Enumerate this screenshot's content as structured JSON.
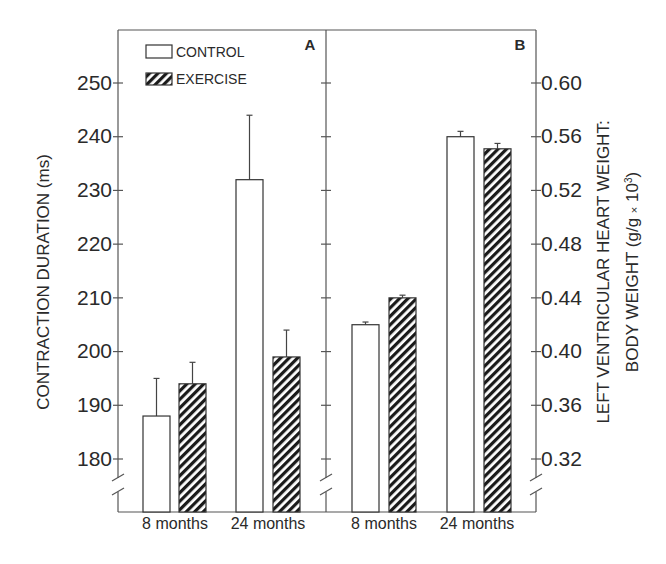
{
  "chart_data": [
    {
      "panel": "A",
      "type": "bar",
      "title": "A",
      "categories": [
        "8 months",
        "24 months"
      ],
      "series": [
        {
          "name": "CONTROL",
          "values": [
            188,
            232
          ],
          "error_upper": [
            195,
            244
          ],
          "pattern": "open"
        },
        {
          "name": "EXERCISE",
          "values": [
            194,
            199
          ],
          "error_upper": [
            198,
            204
          ],
          "pattern": "hatched"
        }
      ],
      "ylabel": "CONTRACTION DURATION (ms)",
      "yticks": [
        180,
        190,
        200,
        210,
        220,
        230,
        240,
        250
      ],
      "ylim": [
        180,
        250
      ],
      "axis_break": true,
      "grid": false,
      "legend_position": "upper left"
    },
    {
      "panel": "B",
      "type": "bar",
      "title": "B",
      "categories": [
        "8 months",
        "24 months"
      ],
      "series": [
        {
          "name": "CONTROL",
          "values": [
            0.42,
            0.56
          ],
          "error_upper": [
            0.422,
            0.564
          ],
          "pattern": "open"
        },
        {
          "name": "EXERCISE",
          "values": [
            0.44,
            0.551
          ],
          "error_upper": [
            0.442,
            0.555
          ],
          "pattern": "hatched"
        }
      ],
      "ylabel": "LEFT VENTRICULAR HEART WEIGHT: BODY WEIGHT (g/g × 10³)",
      "yticks": [
        0.32,
        0.36,
        0.4,
        0.44,
        0.48,
        0.52,
        0.56,
        0.6
      ],
      "ylim": [
        0.32,
        0.6
      ],
      "axis_break": true,
      "grid": false
    }
  ],
  "legend": {
    "control_label": "CONTROL",
    "exercise_label": "EXERCISE"
  },
  "panels": {
    "a_label": "A",
    "b_label": "B"
  },
  "axes": {
    "left_label": "CONTRACTION DURATION (ms)",
    "right_label_line1": "LEFT VENTRICULAR HEART WEIGHT:",
    "right_label_line2_main": "BODY WEIGHT (g/g ",
    "right_label_line2_times": "×",
    "right_label_line2_end": " 10",
    "right_label_line2_sup": "3",
    "right_label_line2_close": ")",
    "left_ticks": [
      "180",
      "190",
      "200",
      "210",
      "220",
      "230",
      "240",
      "250"
    ],
    "right_ticks": [
      "0.32",
      "0.36",
      "0.40",
      "0.44",
      "0.48",
      "0.52",
      "0.56",
      "0.60"
    ],
    "x_categories_a": [
      "8 months",
      "24 months"
    ],
    "x_categories_b": [
      "8 months",
      "24 months"
    ]
  },
  "colors": {
    "ink": "#2a2a2a",
    "background": "#ffffff",
    "axis": "#555555"
  }
}
